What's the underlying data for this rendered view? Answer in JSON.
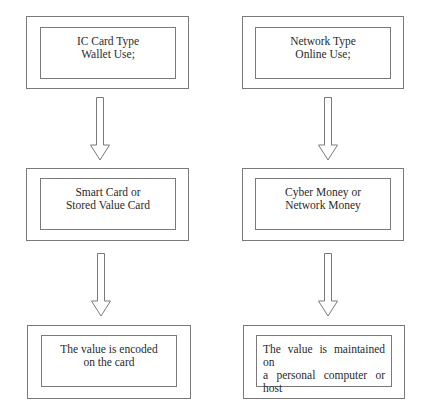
{
  "diagram": {
    "left_column": {
      "box1": {
        "lines": [
          "IC Card Type",
          "Wallet Use;"
        ]
      },
      "box2": {
        "lines": [
          "Smart Card or",
          "Stored Value Card"
        ]
      },
      "box3": {
        "lines": [
          "The value is encoded",
          "on the card"
        ]
      }
    },
    "right_column": {
      "box1": {
        "lines": [
          "Network Type",
          "Online Use;"
        ]
      },
      "box2": {
        "lines": [
          "Cyber Money or",
          "Network Money"
        ]
      },
      "box3": {
        "lines": [
          "The value is maintained on",
          "a personal computer or",
          "host"
        ]
      }
    },
    "arrows": [
      "down-arrow",
      "down-arrow",
      "down-arrow",
      "down-arrow"
    ],
    "colors": {
      "stroke": "#7a7a7a",
      "text": "#2a2a2a",
      "background": "#ffffff"
    }
  }
}
